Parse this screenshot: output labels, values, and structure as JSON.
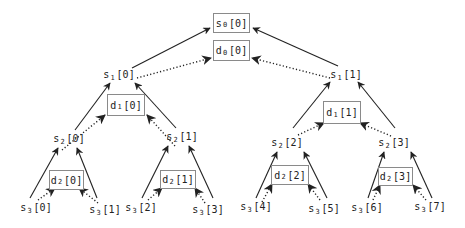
{
  "diagram": {
    "type": "binary-tree-reduction",
    "solid_edge_meaning": "s-node to parent s-node",
    "dotted_edge_meaning": "s-node to d-node",
    "colors": {
      "line": "#222222",
      "box_border": "#8a8a8a",
      "text": "#222222"
    },
    "nodes": [
      {
        "id": "s0_0",
        "base": "s",
        "sub": "0",
        "idx": "[0]",
        "boxed": true,
        "x": 213,
        "y": 13,
        "w": 37,
        "h": 20
      },
      {
        "id": "d0_0",
        "base": "d",
        "sub": "0",
        "idx": "[0]",
        "boxed": true,
        "x": 213,
        "y": 40,
        "w": 37,
        "h": 21
      },
      {
        "id": "s1_0",
        "base": "s",
        "sub": "1",
        "idx": "[0]",
        "boxed": false,
        "cx": 119,
        "cy": 75
      },
      {
        "id": "s1_1",
        "base": "s",
        "sub": "1",
        "idx": "[1]",
        "boxed": false,
        "cx": 346,
        "cy": 75
      },
      {
        "id": "d1_0",
        "base": "d",
        "sub": "1",
        "idx": "[0]",
        "boxed": true,
        "x": 107,
        "y": 94,
        "w": 38,
        "h": 22
      },
      {
        "id": "d1_1",
        "base": "d",
        "sub": "1",
        "idx": "[1]",
        "boxed": true,
        "x": 323,
        "y": 101,
        "w": 38,
        "h": 23
      },
      {
        "id": "s2_0",
        "base": "s",
        "sub": "2",
        "idx": "[0]",
        "boxed": false,
        "cx": 69,
        "cy": 139
      },
      {
        "id": "s2_1",
        "base": "s",
        "sub": "2",
        "idx": "[1]",
        "boxed": false,
        "cx": 182,
        "cy": 137
      },
      {
        "id": "s2_2",
        "base": "s",
        "sub": "2",
        "idx": "[2]",
        "boxed": false,
        "cx": 287,
        "cy": 143
      },
      {
        "id": "s2_3",
        "base": "s",
        "sub": "2",
        "idx": "[3]",
        "boxed": false,
        "cx": 394,
        "cy": 143
      },
      {
        "id": "d2_0",
        "base": "d",
        "sub": "2",
        "idx": "[0]",
        "boxed": true,
        "x": 49,
        "y": 170,
        "w": 35,
        "h": 20
      },
      {
        "id": "d2_1",
        "base": "d",
        "sub": "2",
        "idx": "[1]",
        "boxed": true,
        "x": 160,
        "y": 170,
        "w": 36,
        "h": 19
      },
      {
        "id": "d2_2",
        "base": "d",
        "sub": "2",
        "idx": "[2]",
        "boxed": true,
        "x": 271,
        "y": 165,
        "w": 38,
        "h": 20
      },
      {
        "id": "d2_3",
        "base": "d",
        "sub": "2",
        "idx": "[3]",
        "boxed": true,
        "x": 378,
        "y": 167,
        "w": 35,
        "h": 19
      },
      {
        "id": "s3_0",
        "base": "s",
        "sub": "3",
        "idx": "[0]",
        "boxed": false,
        "cx": 36,
        "cy": 208
      },
      {
        "id": "s3_1",
        "base": "s",
        "sub": "3",
        "idx": "[1]",
        "boxed": false,
        "cx": 105,
        "cy": 210
      },
      {
        "id": "s3_2",
        "base": "s",
        "sub": "3",
        "idx": "[2]",
        "boxed": false,
        "cx": 141,
        "cy": 208
      },
      {
        "id": "s3_3",
        "base": "s",
        "sub": "3",
        "idx": "[3]",
        "boxed": false,
        "cx": 208,
        "cy": 210
      },
      {
        "id": "s3_4",
        "base": "s",
        "sub": "3",
        "idx": "[4]",
        "boxed": false,
        "cx": 256,
        "cy": 207
      },
      {
        "id": "s3_5",
        "base": "s",
        "sub": "3",
        "idx": "[5]",
        "boxed": false,
        "cx": 324,
        "cy": 209
      },
      {
        "id": "s3_6",
        "base": "s",
        "sub": "3",
        "idx": "[6]",
        "boxed": false,
        "cx": 367,
        "cy": 208
      },
      {
        "id": "s3_7",
        "base": "s",
        "sub": "3",
        "idx": "[7]",
        "boxed": false,
        "cx": 430,
        "cy": 207
      }
    ],
    "edges": [
      {
        "from": [
          132,
          68
        ],
        "to": [
          210,
          28
        ],
        "style": "solid"
      },
      {
        "from": [
          338,
          66
        ],
        "to": [
          253,
          28
        ],
        "style": "solid"
      },
      {
        "from": [
          137,
          78
        ],
        "to": [
          211,
          58
        ],
        "style": "dotted"
      },
      {
        "from": [
          330,
          78
        ],
        "to": [
          252,
          58
        ],
        "style": "dotted"
      },
      {
        "from": [
          75,
          130
        ],
        "to": [
          110,
          83
        ],
        "style": "solid"
      },
      {
        "from": [
          176,
          128
        ],
        "to": [
          135,
          83
        ],
        "style": "solid"
      },
      {
        "from": [
          62,
          150
        ],
        "to": [
          105,
          115
        ],
        "style": "dotted"
      },
      {
        "from": [
          175,
          146
        ],
        "to": [
          147,
          115
        ],
        "style": "dotted"
      },
      {
        "from": [
          293,
          128
        ],
        "to": [
          330,
          82
        ],
        "style": "solid"
      },
      {
        "from": [
          395,
          128
        ],
        "to": [
          358,
          82
        ],
        "style": "solid"
      },
      {
        "from": [
          298,
          135
        ],
        "to": [
          324,
          123
        ],
        "style": "dotted"
      },
      {
        "from": [
          391,
          136
        ],
        "to": [
          360,
          123
        ],
        "style": "dotted"
      },
      {
        "from": [
          30,
          198
        ],
        "to": [
          58,
          148
        ],
        "style": "solid"
      },
      {
        "from": [
          97,
          198
        ],
        "to": [
          77,
          148
        ],
        "style": "solid"
      },
      {
        "from": [
          38,
          200
        ],
        "to": [
          55,
          188
        ],
        "style": "dotted"
      },
      {
        "from": [
          98,
          203
        ],
        "to": [
          79,
          188
        ],
        "style": "dotted"
      },
      {
        "from": [
          142,
          198
        ],
        "to": [
          168,
          146
        ],
        "style": "solid"
      },
      {
        "from": [
          213,
          198
        ],
        "to": [
          189,
          146
        ],
        "style": "solid"
      },
      {
        "from": [
          148,
          200
        ],
        "to": [
          162,
          188
        ],
        "style": "dotted"
      },
      {
        "from": [
          205,
          203
        ],
        "to": [
          195,
          188
        ],
        "style": "dotted"
      },
      {
        "from": [
          256,
          198
        ],
        "to": [
          277,
          152
        ],
        "style": "solid"
      },
      {
        "from": [
          327,
          198
        ],
        "to": [
          304,
          152
        ],
        "style": "solid"
      },
      {
        "from": [
          262,
          202
        ],
        "to": [
          272,
          184
        ],
        "style": "dotted"
      },
      {
        "from": [
          320,
          200
        ],
        "to": [
          308,
          184
        ],
        "style": "dotted"
      },
      {
        "from": [
          368,
          198
        ],
        "to": [
          384,
          152
        ],
        "style": "solid"
      },
      {
        "from": [
          432,
          198
        ],
        "to": [
          411,
          152
        ],
        "style": "solid"
      },
      {
        "from": [
          373,
          200
        ],
        "to": [
          380,
          185
        ],
        "style": "dotted"
      },
      {
        "from": [
          426,
          200
        ],
        "to": [
          413,
          185
        ],
        "style": "dotted"
      }
    ]
  }
}
